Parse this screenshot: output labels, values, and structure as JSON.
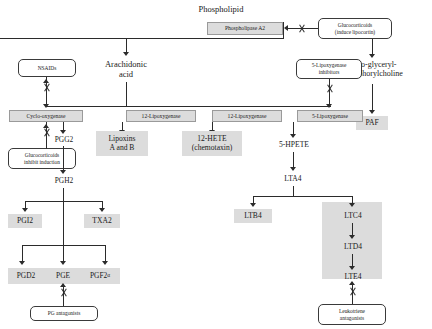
{
  "diagram": {
    "colors": {
      "shaded_fill": "#dcdcdc",
      "line": "#2b2b2b",
      "box_border": "#3a3a3a",
      "background": "#ffffff"
    }
  },
  "nodes": {
    "phospholipid": "Phospholipid",
    "phospholipase_a2": "Phospholipase A2",
    "glucocorticoids_lipocortin_l1": "Glucocorticoids",
    "glucocorticoids_lipocortin_l2": "(induce lipocortin)",
    "arachidonic_l1": "Arachidonic",
    "arachidonic_l2": "acid",
    "lyso_l1": "Lyso-glyceryl-",
    "lyso_l2": "phosphorylcholine",
    "paf": "PAF",
    "nsaids": "NSAIDs",
    "lox5_inhibitors_l1": "5-Lipoxygenase",
    "lox5_inhibitors_l2": "inhibitors",
    "cyclooxygenase": "Cyclo-oxygenase",
    "lipoxygenase_15": "12-Lipoxygenase",
    "lipoxygenase_12": "12-Lipoxygenase",
    "lipoxygenase_5": "5-Lipoxygenase",
    "pgg2": "PGG2",
    "lipoxins_l1": "Lipoxins",
    "lipoxins_l2": "A and B",
    "hete12_l1": "12-HETE",
    "hete12_l2": "(chemotaxin)",
    "hpete5": "5-HPETE",
    "gluco_inhibit_l1": "Glucocorticoids",
    "gluco_inhibit_l2": "inhibit induction",
    "pgh2": "PGH2",
    "lta4": "LTA4",
    "pgi2": "PGI2",
    "txa2": "TXA2",
    "ltb4": "LTB4",
    "ltc4": "LTC4",
    "ltd4": "LTD4",
    "lte4": "LTE4",
    "pgd2": "PGD2",
    "pge": "PGE",
    "pgf2_main": "PGF2",
    "pgf2_sub": "α",
    "pg_antagonists": "PG antagonists",
    "leukotriene_ant_l1": "Leukotriene",
    "leukotriene_ant_l2": "antagonists"
  }
}
